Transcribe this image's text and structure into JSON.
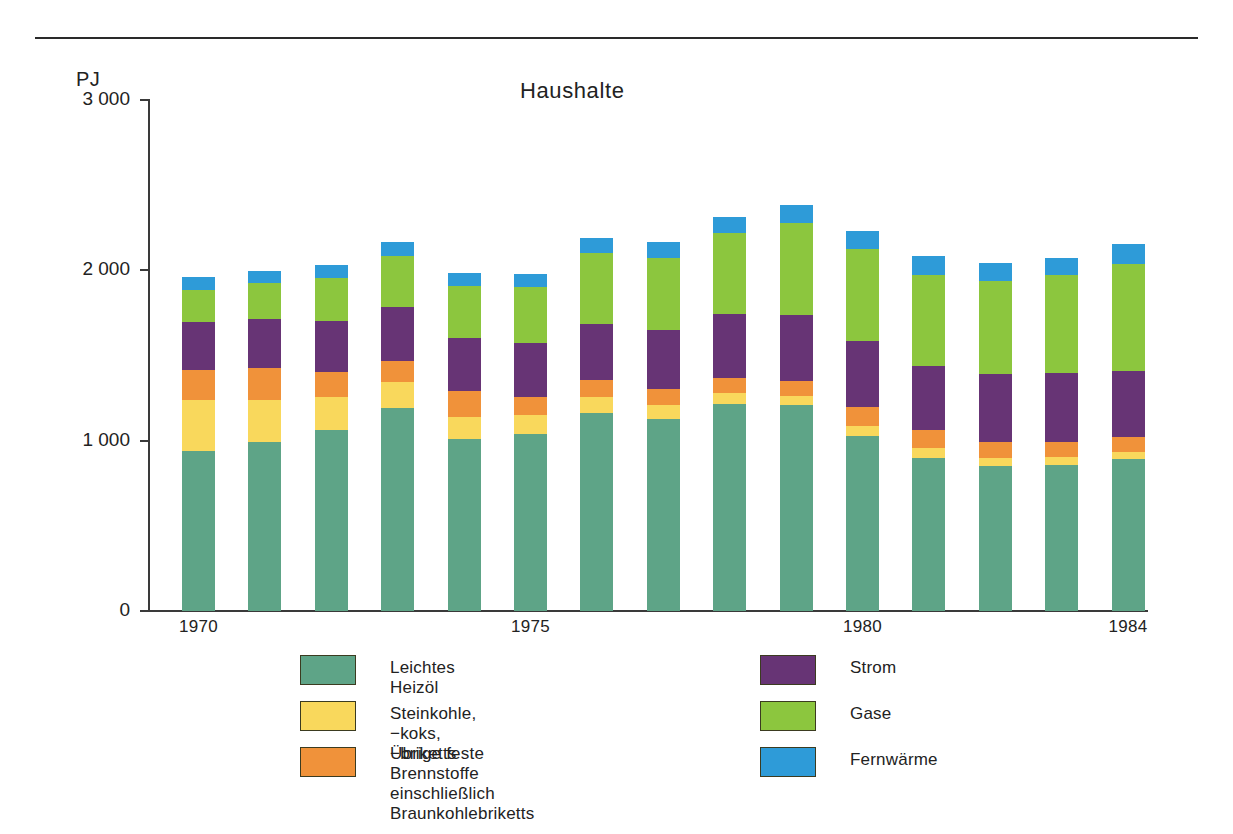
{
  "figure": {
    "unit_label": "PJ",
    "title": "Haushalte"
  },
  "legend": {
    "left": [
      {
        "label": "Leichtes Heizöl",
        "color": "#5ea487",
        "key": "heizoel"
      },
      {
        "label": "Steinkohle, −koks, −briketts",
        "color": "#f9d85c",
        "key": "steinkohle"
      },
      {
        "label": "Übrige feste Brennstoffe\neinschließlich Braunkohlebriketts",
        "color": "#f0923a",
        "key": "uebrige"
      }
    ],
    "right": [
      {
        "label": "Strom",
        "color": "#673475",
        "key": "strom"
      },
      {
        "label": "Gase",
        "color": "#8cc63e",
        "key": "gase"
      },
      {
        "label": "Fernwärme",
        "color": "#2e9bd8",
        "key": "fernwaerme"
      }
    ]
  },
  "chart_data": {
    "type": "bar",
    "stacked": true,
    "title": "Haushalte",
    "xlabel": "",
    "ylabel": "PJ",
    "ylim": [
      0,
      3000
    ],
    "yticks": [
      0,
      1000,
      2000,
      3000
    ],
    "ytick_labels": [
      "0",
      "1 000",
      "2 000",
      "3 000"
    ],
    "grid": false,
    "legend_position": "bottom",
    "categories": [
      1970,
      1971,
      1972,
      1973,
      1974,
      1975,
      1976,
      1977,
      1978,
      1979,
      1980,
      1981,
      1982,
      1983,
      1984
    ],
    "xtick_labels": [
      "1970",
      "1975",
      "1980",
      "1984"
    ],
    "xtick_categories": [
      1970,
      1975,
      1980,
      1984
    ],
    "series": [
      {
        "name": "Leichtes Heizöl",
        "color": "#5ea487",
        "values": [
          940,
          990,
          1060,
          1190,
          1010,
          1040,
          1160,
          1130,
          1215,
          1210,
          1030,
          900,
          850,
          855,
          890
        ]
      },
      {
        "name": "Steinkohle, −koks, −briketts",
        "color": "#f9d85c",
        "values": [
          300,
          250,
          195,
          155,
          130,
          110,
          95,
          80,
          65,
          55,
          55,
          55,
          50,
          50,
          45
        ]
      },
      {
        "name": "Übrige feste Brennstoffe einschließlich Braunkohlebriketts",
        "color": "#f0923a",
        "values": [
          175,
          185,
          150,
          120,
          150,
          105,
          100,
          95,
          90,
          85,
          115,
          105,
          95,
          90,
          85
        ]
      },
      {
        "name": "Strom",
        "color": "#673475",
        "values": [
          280,
          290,
          300,
          320,
          310,
          320,
          330,
          345,
          375,
          385,
          385,
          380,
          395,
          400,
          390
        ]
      },
      {
        "name": "Gase",
        "color": "#8cc63e",
        "values": [
          190,
          210,
          250,
          300,
          310,
          325,
          415,
          425,
          475,
          545,
          540,
          535,
          545,
          575,
          625
        ]
      },
      {
        "name": "Fernwärme",
        "color": "#2e9bd8",
        "values": [
          75,
          70,
          75,
          80,
          75,
          80,
          90,
          90,
          95,
          105,
          105,
          110,
          110,
          105,
          120
        ]
      }
    ]
  }
}
